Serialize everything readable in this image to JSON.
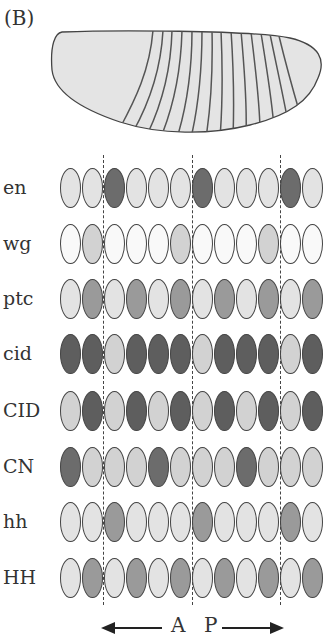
{
  "panel_label": "(B)",
  "colors": {
    "white": "#f9f9f9",
    "light": "#e3e3e3",
    "lightmid": "#d2d2d2",
    "mid": "#9a9a9a",
    "dark": "#6c6c6c",
    "darker": "#5e5e5e"
  },
  "rows": [
    {
      "label": "en",
      "cells": [
        "light",
        "light",
        "dark",
        "light",
        "light",
        "light",
        "dark",
        "light",
        "light",
        "light",
        "dark",
        "light"
      ]
    },
    {
      "label": "wg",
      "cells": [
        "white",
        "lightmid",
        "white",
        "white",
        "white",
        "lightmid",
        "white",
        "white",
        "white",
        "lightmid",
        "white",
        "white"
      ]
    },
    {
      "label": "ptc",
      "cells": [
        "light",
        "mid",
        "light",
        "mid",
        "light",
        "mid",
        "light",
        "mid",
        "light",
        "mid",
        "light",
        "mid"
      ]
    },
    {
      "label": "cid",
      "cells": [
        "darker",
        "darker",
        "lightmid",
        "darker",
        "darker",
        "darker",
        "lightmid",
        "darker",
        "darker",
        "darker",
        "lightmid",
        "darker"
      ]
    },
    {
      "label": "CID",
      "cells": [
        "lightmid",
        "darker",
        "lightmid",
        "darker",
        "lightmid",
        "darker",
        "lightmid",
        "darker",
        "lightmid",
        "darker",
        "lightmid",
        "darker"
      ]
    },
    {
      "label": "CN",
      "cells": [
        "dark",
        "lightmid",
        "lightmid",
        "lightmid",
        "dark",
        "lightmid",
        "lightmid",
        "lightmid",
        "dark",
        "lightmid",
        "lightmid",
        "lightmid"
      ]
    },
    {
      "label": "hh",
      "cells": [
        "light",
        "light",
        "mid",
        "light",
        "light",
        "light",
        "mid",
        "light",
        "light",
        "light",
        "mid",
        "light"
      ]
    },
    {
      "label": "HH",
      "cells": [
        "light",
        "mid",
        "light",
        "mid",
        "light",
        "mid",
        "light",
        "mid",
        "light",
        "mid",
        "light",
        "mid"
      ]
    }
  ],
  "axis": {
    "anterior": "A",
    "posterior": "P"
  }
}
